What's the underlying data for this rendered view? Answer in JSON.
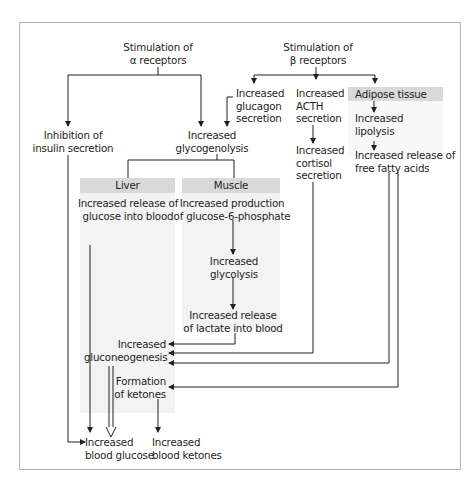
{
  "diagram": {
    "title_alpha": [
      "Stimulation of",
      "α receptors"
    ],
    "title_beta": [
      "Stimulation of",
      "β receptors"
    ],
    "alpha_branch": {
      "inhibition": [
        "Inhibition of",
        "insulin secretion"
      ],
      "glycogenolysis": [
        "Increased",
        "glycogenolysis"
      ]
    },
    "beta_branch": {
      "glucagon": [
        "Increased",
        "glucagon",
        "secretion"
      ],
      "acth": [
        "Increased",
        "ACTH",
        "secretion"
      ],
      "cortisol": [
        "Increased",
        "cortisol",
        "secretion"
      ],
      "adipose_header": "Adipose tissue",
      "lipolysis": [
        "Increased",
        "lipolysis"
      ],
      "ffa": [
        "Increased release of",
        "free fatty acids"
      ]
    },
    "liver": {
      "header": "Liver",
      "release": [
        "Increased release of",
        "glucose into blood"
      ],
      "gluconeogenesis": [
        "Increased",
        "gluconeogenesis"
      ],
      "ketones": [
        "Formation",
        "of ketones"
      ]
    },
    "muscle": {
      "header": "Muscle",
      "g6p": [
        "Increased production",
        "of glucose-6-phosphate"
      ],
      "glycolysis": [
        "Increased",
        "glycolysis"
      ],
      "lactate": [
        "Increased release",
        "of lactate into blood"
      ]
    },
    "outcomes": {
      "blood_glucose": [
        "Increased",
        "blood glucose"
      ],
      "blood_ketones": [
        "Increased",
        "blood ketones"
      ]
    },
    "colors": {
      "line": "#231f20",
      "header_fill": "#d9d9d9",
      "panel_fill": "#f3f3f3",
      "frame": "#b3b3b3"
    }
  }
}
